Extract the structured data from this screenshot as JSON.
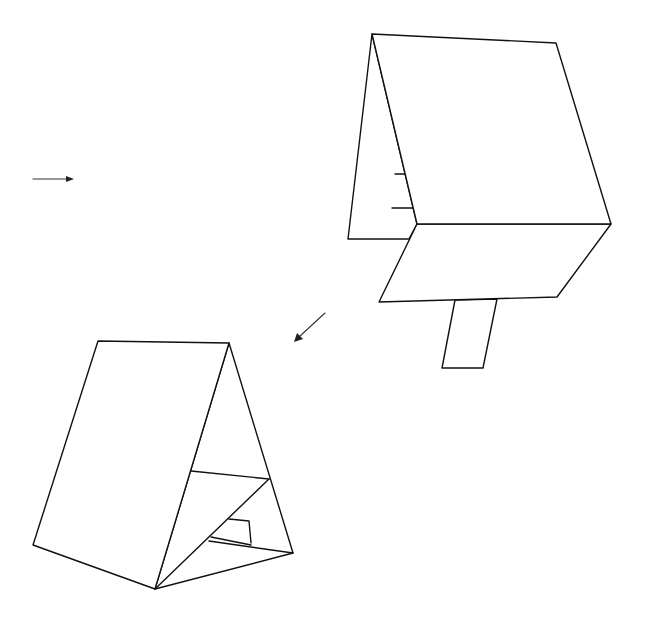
{
  "figure": {
    "title": "Folding tent card assembly diagram",
    "colors": {
      "background": "#ffffff",
      "line": "#111111"
    }
  },
  "views": [
    {
      "id": "view-unfolded",
      "label": "Card stand, partially folded with tab extended",
      "parts": [
        "back-panel",
        "front-panel",
        "lower-flap",
        "tab",
        "slot-marks"
      ]
    },
    {
      "id": "view-assembled",
      "label": "Card stand, assembled A-frame with tab inserted",
      "parts": [
        "front-panel",
        "rear-panel",
        "inner-brace",
        "tab-slot"
      ]
    }
  ],
  "arrows": [
    {
      "id": "arrow-right",
      "direction": "right"
    },
    {
      "id": "arrow-down-left",
      "direction": "down-left"
    }
  ]
}
